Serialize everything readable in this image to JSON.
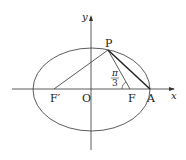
{
  "diagram": {
    "type": "ellipse-geometry",
    "axes": {
      "x_label": "x",
      "y_label": "y"
    },
    "points": {
      "P": "P",
      "F_prime": "F′",
      "O": "O",
      "F": "F",
      "A": "A"
    },
    "angle_label": {
      "numerator": "π",
      "denominator": "3"
    },
    "colors": {
      "stroke": "#333333",
      "background": "#ffffff"
    }
  }
}
